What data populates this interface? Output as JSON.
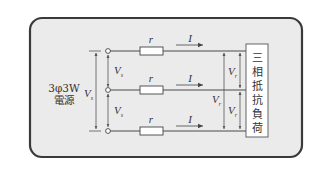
{
  "diagram": {
    "type": "three-phase-circuit",
    "source": {
      "label_line1": "3φ3W",
      "label_line2": "電源",
      "line_voltage": "V",
      "line_voltage_sub": "s",
      "phase_to_phase_top": "V",
      "phase_to_phase_top_sub": "s",
      "phase_to_phase_bottom": "V",
      "phase_to_phase_bottom_sub": "s"
    },
    "lines": [
      {
        "resistor": "r",
        "current": "I"
      },
      {
        "resistor": "r",
        "current": "I"
      },
      {
        "resistor": "r",
        "current": "I"
      }
    ],
    "load": {
      "label_chars": [
        "三",
        "相",
        "抵",
        "抗",
        "負",
        "荷"
      ],
      "line_voltage": "V",
      "line_voltage_sub": "r",
      "phase_to_phase_top": "V",
      "phase_to_phase_top_sub": "r",
      "phase_to_phase_bottom": "V",
      "phase_to_phase_bottom_sub": "r"
    },
    "colors": {
      "frame_border": "#3a3a3a",
      "frame_fill": "#ebebeb",
      "wire": "#4a4a4a",
      "load_fill": "#ffffff"
    }
  }
}
